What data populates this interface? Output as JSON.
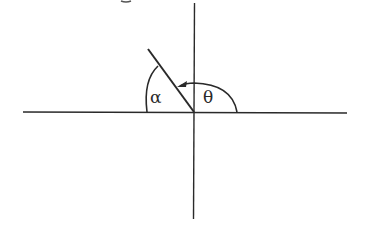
{
  "diagram": {
    "type": "angle-diagram",
    "labels": {
      "alpha": "α",
      "theta": "θ"
    },
    "colors": {
      "stroke": "#2a2a2a",
      "background": "#ffffff"
    },
    "elements": [
      {
        "id": "x-axis",
        "kind": "line",
        "desc": "horizontal axis"
      },
      {
        "id": "y-axis",
        "kind": "line",
        "desc": "vertical axis"
      },
      {
        "id": "terminal-ray",
        "kind": "line",
        "desc": "ray in second quadrant from origin"
      },
      {
        "id": "alpha-arc",
        "kind": "arc",
        "desc": "reference angle alpha between negative x-axis and ray"
      },
      {
        "id": "theta-arc",
        "kind": "arc-arrow",
        "desc": "angle theta from positive x-axis counterclockwise to ray"
      }
    ]
  }
}
